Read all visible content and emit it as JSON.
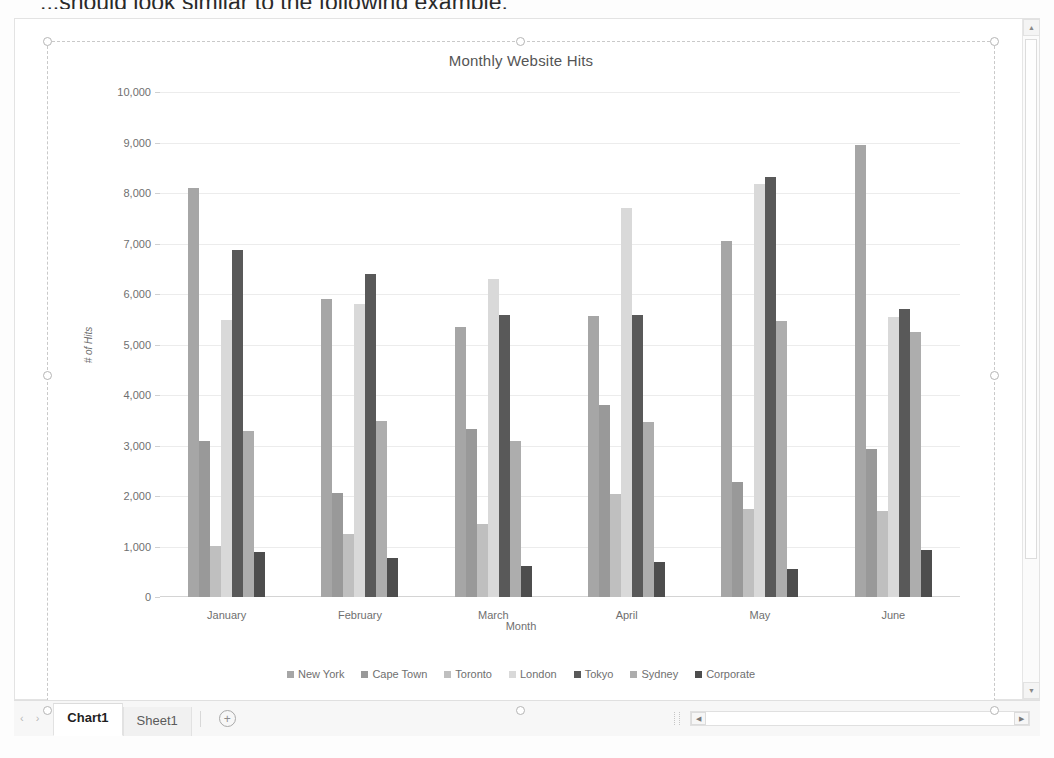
{
  "document": {
    "cut_off_text": "...should look similar to the following example."
  },
  "chart": {
    "title": "Monthly Website Hits",
    "xlabel": "Month",
    "ylabel": "# of Hits"
  },
  "chart_data": {
    "type": "bar",
    "title": "Monthly Website Hits",
    "xlabel": "Month",
    "ylabel": "# of Hits",
    "ylim": [
      0,
      10000
    ],
    "ytick_step": 1000,
    "ytick_labels": [
      "0",
      "1,000",
      "2,000",
      "3,000",
      "4,000",
      "5,000",
      "6,000",
      "7,000",
      "8,000",
      "9,000",
      "10,000"
    ],
    "grid": true,
    "legend_position": "bottom",
    "categories": [
      "January",
      "February",
      "March",
      "April",
      "May",
      "June"
    ],
    "series": [
      {
        "name": "New York",
        "color": "#a6a6a6",
        "values": [
          8100,
          5900,
          5350,
          5570,
          7050,
          8950
        ]
      },
      {
        "name": "Cape Town",
        "color": "#999999",
        "values": [
          3080,
          2060,
          3320,
          3800,
          2270,
          2930
        ]
      },
      {
        "name": "Toronto",
        "color": "#bfbfbf",
        "values": [
          1010,
          1250,
          1450,
          2040,
          1740,
          1700
        ]
      },
      {
        "name": "London",
        "color": "#d9d9d9",
        "values": [
          5480,
          5800,
          6300,
          7700,
          8180,
          5540
        ]
      },
      {
        "name": "Tokyo",
        "color": "#595959",
        "values": [
          6880,
          6400,
          5580,
          5590,
          8320,
          5700
        ]
      },
      {
        "name": "Sydney",
        "color": "#adadad",
        "values": [
          3280,
          3480,
          3080,
          3460,
          5460,
          5250
        ]
      },
      {
        "name": "Corporate",
        "color": "#4d4d4d",
        "values": [
          890,
          770,
          610,
          690,
          550,
          930
        ]
      }
    ]
  },
  "sheet_tabs": {
    "prev_label": "‹",
    "next_label": "›",
    "tabs": [
      {
        "label": "Chart1",
        "active": true
      },
      {
        "label": "Sheet1",
        "active": false
      }
    ],
    "add_sheet_label": "+"
  },
  "scrollbars": {
    "vertical_up": "▲",
    "vertical_down": "▼",
    "horizontal_left": "◀",
    "horizontal_right": "▶"
  }
}
